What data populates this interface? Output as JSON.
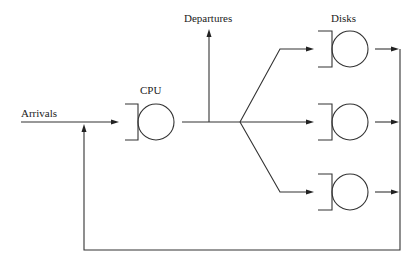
{
  "diagram": {
    "type": "queueing-network",
    "labels": {
      "arrivals": "Arrivals",
      "cpu": "CPU",
      "departures": "Departures",
      "disks": "Disks"
    },
    "nodes": [
      {
        "id": "cpu",
        "label": "CPU",
        "kind": "queue-server"
      },
      {
        "id": "disk1",
        "label": "",
        "kind": "queue-server"
      },
      {
        "id": "disk2",
        "label": "",
        "kind": "queue-server"
      },
      {
        "id": "disk3",
        "label": "",
        "kind": "queue-server"
      }
    ],
    "edges": [
      {
        "from": "arrivals",
        "to": "cpu"
      },
      {
        "from": "cpu",
        "to": "departures"
      },
      {
        "from": "cpu",
        "to": "disk1"
      },
      {
        "from": "cpu",
        "to": "disk2"
      },
      {
        "from": "cpu",
        "to": "disk3"
      },
      {
        "from": "disk1",
        "to": "cpu",
        "via": "feedback"
      },
      {
        "from": "disk2",
        "to": "cpu",
        "via": "feedback"
      },
      {
        "from": "disk3",
        "to": "cpu",
        "via": "feedback"
      }
    ],
    "colors": {
      "stroke": "#333333",
      "text": "#222222",
      "background": "#ffffff"
    }
  }
}
